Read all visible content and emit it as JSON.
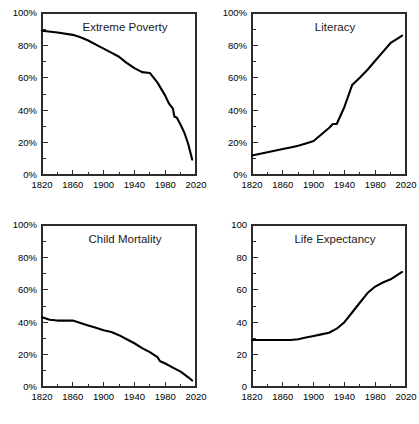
{
  "figure": {
    "background": "#ffffff",
    "line_color": "#000000",
    "axis_color": "#2b2b2b",
    "panel_count": 4,
    "layout": "2x2 grid of line charts"
  },
  "chart_data": [
    {
      "type": "line",
      "title": "Extreme Poverty",
      "xlabel": "",
      "ylabel": "",
      "xlim": [
        1820,
        2020
      ],
      "ylim": [
        0,
        100
      ],
      "grid": false,
      "legend": "none",
      "x_ticks": [
        1820,
        1860,
        1900,
        1940,
        1980,
        2020
      ],
      "x_tick_labels": [
        "1820",
        "1860",
        "1900",
        "1940",
        "1980",
        "2020"
      ],
      "y_ticks": [
        0,
        20,
        40,
        60,
        80,
        100
      ],
      "y_tick_labels": [
        "0%",
        "20%",
        "40%",
        "60%",
        "80%",
        "100%"
      ],
      "x_minor_interval": 20,
      "y_minor_interval": 10,
      "x": [
        1820,
        1840,
        1860,
        1870,
        1880,
        1890,
        1900,
        1910,
        1920,
        1929,
        1940,
        1950,
        1960,
        1970,
        1980,
        1985,
        1990,
        1992,
        1995,
        2000,
        2005,
        2010,
        2015
      ],
      "values": [
        89,
        88,
        86.5,
        85,
        83,
        80.5,
        78,
        75.5,
        73,
        69.5,
        66,
        63.5,
        63,
        57,
        49,
        44,
        41,
        36,
        35.5,
        31,
        26,
        19,
        9.5
      ],
      "series_name": "Share of world population in extreme poverty",
      "units": "percent"
    },
    {
      "type": "line",
      "title": "Literacy",
      "xlabel": "",
      "ylabel": "",
      "xlim": [
        1820,
        2020
      ],
      "ylim": [
        0,
        100
      ],
      "grid": false,
      "legend": "none",
      "x_ticks": [
        1820,
        1860,
        1900,
        1940,
        1980,
        2020
      ],
      "x_tick_labels": [
        "1820",
        "1860",
        "1900",
        "1940",
        "1980",
        "2020"
      ],
      "y_ticks": [
        0,
        20,
        40,
        60,
        80,
        100
      ],
      "y_tick_labels": [
        "0%",
        "20%",
        "40%",
        "60%",
        "80%",
        "100%"
      ],
      "x_minor_interval": 20,
      "y_minor_interval": 10,
      "x": [
        1820,
        1840,
        1860,
        1870,
        1880,
        1890,
        1900,
        1910,
        1920,
        1925,
        1930,
        1940,
        1950,
        1960,
        1970,
        1980,
        1990,
        2000,
        2010,
        2015
      ],
      "values": [
        12,
        14,
        16,
        17,
        18,
        19.5,
        21,
        25,
        29,
        31.5,
        31.5,
        42,
        55.5,
        60,
        65,
        70.5,
        76,
        81.5,
        84.5,
        86
      ],
      "series_name": "Share of world population that is literate",
      "units": "percent"
    },
    {
      "type": "line",
      "title": "Child Mortality",
      "xlabel": "",
      "ylabel": "",
      "xlim": [
        1820,
        2020
      ],
      "ylim": [
        0,
        100
      ],
      "grid": false,
      "legend": "none",
      "x_ticks": [
        1820,
        1860,
        1900,
        1940,
        1980,
        2020
      ],
      "x_tick_labels": [
        "1820",
        "1860",
        "1900",
        "1940",
        "1980",
        "2020"
      ],
      "y_ticks": [
        0,
        20,
        40,
        60,
        80,
        100
      ],
      "y_tick_labels": [
        "0%",
        "20%",
        "40%",
        "60%",
        "80%",
        "100%"
      ],
      "x_minor_interval": 20,
      "y_minor_interval": 10,
      "x": [
        1820,
        1830,
        1840,
        1850,
        1860,
        1870,
        1880,
        1890,
        1900,
        1910,
        1920,
        1930,
        1940,
        1950,
        1960,
        1970,
        1973,
        1980,
        1990,
        2000,
        2010,
        2015
      ],
      "values": [
        43,
        41.5,
        41,
        41,
        41,
        39.5,
        38,
        36.5,
        35,
        34,
        32,
        29.5,
        27,
        24,
        21.5,
        18.5,
        16,
        14.5,
        12,
        9.5,
        6,
        4
      ],
      "series_name": "Share of children dying before age five",
      "units": "percent"
    },
    {
      "type": "line",
      "title": "Life Expectancy",
      "xlabel": "",
      "ylabel": "",
      "xlim": [
        1820,
        2020
      ],
      "ylim": [
        0,
        100
      ],
      "grid": false,
      "legend": "none",
      "x_ticks": [
        1820,
        1860,
        1900,
        1940,
        1980,
        2020
      ],
      "x_tick_labels": [
        "1820",
        "1860",
        "1900",
        "1940",
        "1980",
        "2020"
      ],
      "y_ticks": [
        0,
        20,
        40,
        60,
        80,
        100
      ],
      "y_tick_labels": [
        "0",
        "20",
        "40",
        "60",
        "80",
        "100"
      ],
      "x_minor_interval": 20,
      "y_minor_interval": 10,
      "x": [
        1820,
        1840,
        1860,
        1870,
        1880,
        1890,
        1900,
        1910,
        1920,
        1930,
        1940,
        1950,
        1960,
        1970,
        1975,
        1980,
        1990,
        2000,
        2010,
        2015
      ],
      "values": [
        29,
        29,
        29,
        29,
        29.5,
        30.5,
        31.5,
        32.5,
        33.5,
        36,
        40,
        46,
        52,
        58,
        60,
        62,
        64.5,
        66.5,
        69.5,
        71
      ],
      "series_name": "Average life expectancy at birth",
      "units": "years"
    }
  ]
}
